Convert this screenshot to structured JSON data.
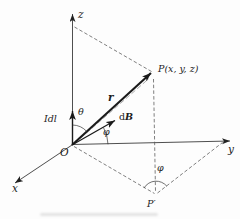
{
  "figure": {
    "title_semantic": "3D coordinate diagram of Biot-Savart law: current element Idl at origin producing field dB at point P",
    "colors": {
      "background": "#fdfdfd",
      "ink": "#222222",
      "dashed_line": "#555555",
      "thin_companion_line": "#8a8a8a"
    },
    "labels": {
      "z_axis": "z",
      "y_axis": "y",
      "x_axis": "x",
      "origin": "O",
      "point_p": "P(x, y, z)",
      "vector_r": "r",
      "db": {
        "d": "d",
        "b": "B"
      },
      "idl": {
        "i": "I",
        "d": "d",
        "l": "l"
      },
      "theta": "θ",
      "phi_origin": "φ",
      "phi_projection": "φ",
      "point_p_prime": "P′"
    }
  }
}
